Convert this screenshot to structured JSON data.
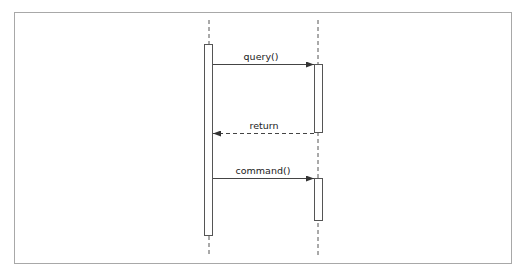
{
  "diagram": {
    "type": "sequence",
    "lifelines": [
      {
        "id": "caller",
        "x": 209,
        "activation": {
          "top": 44,
          "bottom": 236
        }
      },
      {
        "id": "callee",
        "x": 318,
        "activations": [
          {
            "top": 64,
            "bottom": 133
          },
          {
            "top": 178,
            "bottom": 221
          }
        ]
      }
    ],
    "messages": [
      {
        "label": "query()",
        "from": "caller",
        "to": "callee",
        "y": 64,
        "style": "solid"
      },
      {
        "label": "return",
        "from": "callee",
        "to": "caller",
        "y": 133,
        "style": "dashed"
      },
      {
        "label": "command()",
        "from": "caller",
        "to": "callee",
        "y": 178,
        "style": "solid"
      }
    ],
    "colors": {
      "stroke": "#444444",
      "frame": "#a8a8a8",
      "text": "#222222"
    }
  }
}
